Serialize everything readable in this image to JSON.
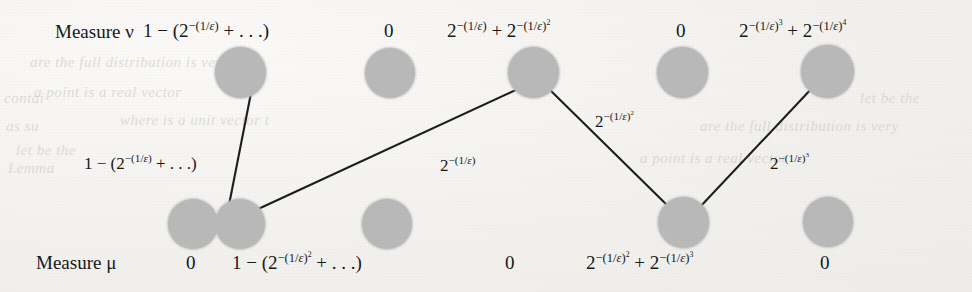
{
  "figure": {
    "type": "transport-plan-diagram",
    "node_color": "#b9b9b9",
    "edge_color": "#1b1d1f",
    "background_color": "#f4f3f1",
    "row_labels": {
      "top": "Measure ν",
      "bottom": "Measure μ"
    },
    "top_row": {
      "count": 5,
      "masses": [
        "1 − (2−(1/ϵ) + . . .)",
        "0",
        "2−(1/ϵ) + 2−(1/ϵ)²",
        "0",
        "2−(1/ϵ)³ + 2−(1/ϵ)⁴"
      ],
      "mass_parts": [
        {
          "kind": "one-minus-series",
          "lead": "1 − (2",
          "exp": "−(1/ϵ)",
          "tail": " + . . .)"
        },
        {
          "kind": "zero",
          "text": "0"
        },
        {
          "kind": "two-term",
          "a_base": "2",
          "a_exp": "−(1/ϵ)",
          "a_pow": "",
          "b_base": "2",
          "b_exp": "−(1/ϵ)",
          "b_pow": "2"
        },
        {
          "kind": "zero",
          "text": "0"
        },
        {
          "kind": "two-term",
          "a_base": "2",
          "a_exp": "−(1/ϵ)",
          "a_pow": "3",
          "b_base": "2",
          "b_exp": "−(1/ϵ)",
          "b_pow": "4"
        }
      ]
    },
    "bottom_row": {
      "count": 5,
      "masses": [
        "0",
        "1 − (2−(1/ϵ)² + . . .)",
        "0",
        "2−(1/ϵ)² + 2−(1/ϵ)³",
        "0"
      ],
      "mass_parts": [
        {
          "kind": "zero",
          "text": "0"
        },
        {
          "kind": "one-minus-series",
          "lead": "1 − (2",
          "exp": "−(1/ϵ)",
          "pow": "2",
          "tail": " + . . .)"
        },
        {
          "kind": "zero",
          "text": "0"
        },
        {
          "kind": "two-term",
          "a_base": "2",
          "a_exp": "−(1/ϵ)",
          "a_pow": "2",
          "b_base": "2",
          "b_exp": "−(1/ϵ)",
          "b_pow": "3"
        },
        {
          "kind": "zero",
          "text": "0"
        }
      ]
    },
    "edges": [
      {
        "id": "e1",
        "from": "top-node-1",
        "to": "bottom-node-2",
        "label": "1 − (2−(1/ϵ) + . . .)",
        "label_parts": {
          "kind": "one-minus-series",
          "lead": "1 − (2",
          "exp": "−(1/ϵ)",
          "pow": "",
          "tail": " + . . .)"
        }
      },
      {
        "id": "e2",
        "from": "bottom-node-2",
        "to": "top-node-3",
        "label": "2−(1/ϵ)",
        "label_parts": {
          "kind": "power",
          "base": "2",
          "exp": "−(1/ϵ)",
          "pow": ""
        }
      },
      {
        "id": "e3",
        "from": "top-node-3",
        "to": "bottom-node-4",
        "label": "2−(1/ϵ)²",
        "label_parts": {
          "kind": "power",
          "base": "2",
          "exp": "−(1/ϵ)",
          "pow": "2"
        }
      },
      {
        "id": "e4",
        "from": "bottom-node-4",
        "to": "top-node-5",
        "label": "2−(1/ϵ)³",
        "label_parts": {
          "kind": "power",
          "base": "2",
          "exp": "−(1/ϵ)",
          "pow": "3"
        }
      }
    ],
    "ghost_text": [
      "are the full distribution is very",
      "a point   is a real vector",
      "where   is a unit vector  t",
      "let   be the",
      "contai",
      "as   su",
      "Lemma"
    ]
  }
}
